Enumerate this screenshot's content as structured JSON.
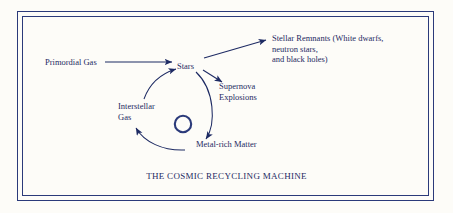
{
  "diagram": {
    "caption": "THE COSMIC RECYCLING MACHINE",
    "ink_color": "#1d2a63",
    "frame_color": "#2b3a7a",
    "nodes": [
      {
        "id": "primordial-gas",
        "label": "Primordial Gas",
        "x": 45,
        "y": 58
      },
      {
        "id": "stars",
        "label": "Stars",
        "x": 186,
        "y": 62
      },
      {
        "id": "stellar-remnants",
        "label": "Stellar Remnants (White dwarfs,\nneutron stars,\nand black holes)",
        "x": 272,
        "y": 38
      },
      {
        "id": "supernova-explosions",
        "label": "Supernova\nExplosions",
        "x": 219,
        "y": 86
      },
      {
        "id": "interstellar-gas",
        "label": "Interstellar\nGas",
        "x": 120,
        "y": 106
      },
      {
        "id": "metal-rich-matter",
        "label": "Metal-rich Matter",
        "x": 196,
        "y": 144
      }
    ],
    "arrows": [
      {
        "id": "arrow-primordial-to-stars",
        "from": "primordial-gas",
        "to": "stars"
      },
      {
        "id": "arrow-stars-to-remnants",
        "from": "stars",
        "to": "stellar-remnants"
      },
      {
        "id": "arrow-stars-to-supernova",
        "from": "stars",
        "to": "supernova-explosions"
      },
      {
        "id": "arrow-cycle-stars-to-metals",
        "from": "stars",
        "to": "metal-rich-matter"
      },
      {
        "id": "arrow-cycle-metals-to-interstellar",
        "from": "metal-rich-matter",
        "to": "interstellar-gas"
      },
      {
        "id": "arrow-cycle-interstellar-to-stars",
        "from": "interstellar-gas",
        "to": "stars"
      }
    ],
    "center_symbol": {
      "id": "recycling-hub",
      "shape": "ring",
      "x": 183,
      "y": 124,
      "radius": 8
    }
  }
}
